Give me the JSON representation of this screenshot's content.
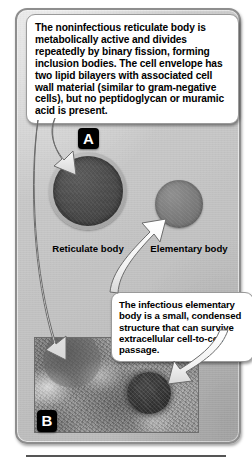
{
  "figure": {
    "background_color": "#ffffff",
    "card_color": "#c6c6c6",
    "accent_color": "#000000"
  },
  "callouts": {
    "a": {
      "id": "callout-a",
      "text": "The noninfectious reticulate body is metabolically active and divides repeatedly by binary fission, forming inclusion bodies. The cell envelope has two lipid bilayers with associated cell wall material (similar to gram-negative cells), but no peptidoglycan or muramic acid is present."
    },
    "b": {
      "id": "callout-b",
      "text": "The infectious elementary body is a small, condensed structure that can survive extracellular cell-to-cell passage."
    }
  },
  "panel_a": {
    "tag": "A",
    "organisms": [
      {
        "name": "reticulate-body",
        "label": "Reticulate body",
        "color": "#4a4a4a"
      },
      {
        "name": "elementary-body",
        "label": "Elementary body",
        "color": "#767676"
      }
    ]
  },
  "panel_b": {
    "tag": "B",
    "caption": "",
    "description": "Transmission electron micrograph showing a dense elementary body within host cell cytoplasm"
  },
  "arrows": [
    {
      "name": "arrow-to-reticulate-body",
      "from": "callout-a",
      "to": "reticulate-body"
    },
    {
      "name": "arrow-to-elementary-body",
      "from": "callout-b",
      "to": "elementary-body"
    },
    {
      "name": "arrow-to-micrograph-reticulate",
      "from": "callout-a",
      "to": "micrograph-reticulate-body"
    },
    {
      "name": "arrow-to-micrograph-elementary",
      "from": "callout-b",
      "to": "micrograph-elementary-body"
    }
  ]
}
